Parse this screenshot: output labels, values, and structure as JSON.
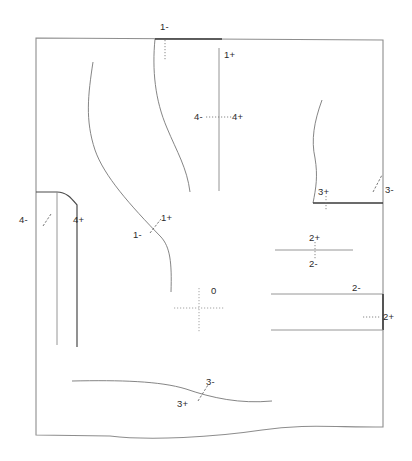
{
  "figure": {
    "kind": "technical-deviation-diagram",
    "width": 412,
    "height": 461,
    "background_color": "#ffffff",
    "line_color": "#6e6e6e",
    "bold_line_color": "#3a3a3a",
    "tick_color": "#6a6a6a",
    "label_color": "#2b2b2b"
  },
  "labels": {
    "top_1_minus": "1-",
    "top_1_plus": "1+",
    "mid_4_minus": "4-",
    "mid_4_plus": "4+",
    "left_4_minus": "4-",
    "left_4_plus": "4+",
    "inner_1_minus": "1-",
    "inner_1_plus": "1+",
    "right_3_plus": "3+",
    "right_3_minus": "3-",
    "right_2_plus": "2+",
    "right_2_minus": "2-",
    "low_2_minus": "2-",
    "low_2_plus": "2+",
    "origin_zero": "0",
    "bottom_3_minus": "3-",
    "bottom_3_plus": "3+"
  },
  "markers": [
    {
      "name": "top-1-minus-marker",
      "label": "1-",
      "tick": "dotted-vertical",
      "x": 166,
      "y": 30
    },
    {
      "name": "top-1-plus-marker",
      "label": "1+",
      "tick": "solid-vertical",
      "x": 226,
      "y": 56
    },
    {
      "name": "mid-4-pair-marker",
      "label": "4- 4+",
      "tick": "dotted-horizontal",
      "x": 219,
      "y": 117
    },
    {
      "name": "left-4-pair-marker",
      "label": "4- 4+",
      "tick": "dashed-diagonal",
      "x": 47,
      "y": 221
    },
    {
      "name": "inner-1-pair-marker",
      "label": "1- 1+",
      "tick": "dashed-diagonal",
      "x": 155,
      "y": 228
    },
    {
      "name": "right-3-plus-marker",
      "label": "3+",
      "tick": "dotted-vertical",
      "x": 326,
      "y": 193
    },
    {
      "name": "right-3-minus-marker",
      "label": "3-",
      "tick": "dashed-diagonal",
      "x": 379,
      "y": 188
    },
    {
      "name": "right-2-pair-marker",
      "label": "2+ 2-",
      "tick": "dotted-vertical",
      "x": 315,
      "y": 250
    },
    {
      "name": "low-2-minus-marker",
      "label": "2-",
      "tick": "none",
      "x": 357,
      "y": 289
    },
    {
      "name": "low-2-plus-marker",
      "label": "2+",
      "tick": "dotted-horizontal",
      "x": 386,
      "y": 320
    },
    {
      "name": "origin-marker",
      "label": "0",
      "tick": "dotted-crosshair",
      "x": 192,
      "y": 308
    },
    {
      "name": "bottom-3-pair-marker",
      "label": "3- 3+",
      "tick": "dashed-diagonal",
      "x": 203,
      "y": 396
    }
  ],
  "geometry": {
    "outline_note": "closed boundary: straight top, left and right edges with a wavy lower edge",
    "outline_path": "M 36 38 L 383 40 L 383 427 C 330 427 300 424 262 430 C 215 437 150 441 110 436 L 36 435 Z",
    "top_left": [
      36,
      38
    ],
    "top_right": [
      383,
      40
    ],
    "bottom_right": [
      383,
      427
    ],
    "bottom_left": [
      36,
      435
    ]
  },
  "curves": [
    {
      "name": "left-s-curve",
      "path": "M 93 62 C 88 95 85 120 95 150 C 104 176 130 205 161 237 C 170 247 172 262 171 292"
    },
    {
      "name": "center-s-curve",
      "path": "M 155 39 C 152 70 155 100 167 128 C 177 152 187 168 190 192"
    },
    {
      "name": "vertical-1plus-line",
      "path": "M 219 48 L 219 191"
    },
    {
      "name": "right-wavy-curve",
      "path": "M 322 100 C 314 122 311 140 315 158 C 318 176 316 188 313 203"
    },
    {
      "name": "left-step-top",
      "path": "M 36 192 L 57 192 C 67 192 72 199 77 205 L 77 347"
    },
    {
      "name": "left-inner-vertical",
      "path": "M 57 192 L 57 345"
    },
    {
      "name": "bottom-wave-curve",
      "path": "M 72 381 C 120 380 160 381 186 389 C 212 398 240 404 272 401"
    }
  ],
  "segments": [
    {
      "name": "top-bold-segment",
      "path": "M 155 39 L 222 39",
      "weight": "bold"
    },
    {
      "name": "right-bold-segment",
      "path": "M 313 203 L 383 203",
      "weight": "bold"
    },
    {
      "name": "seg-2pair-line",
      "path": "M 275 250 L 353 250",
      "weight": "thin"
    },
    {
      "name": "seg-low-upper-line",
      "path": "M 271 294 L 383 294",
      "weight": "thin"
    },
    {
      "name": "seg-low-vertical",
      "path": "M 383 294 L 383 330",
      "weight": "bold"
    },
    {
      "name": "seg-low-lower-line",
      "path": "M 271 330 L 383 330",
      "weight": "thin"
    }
  ]
}
